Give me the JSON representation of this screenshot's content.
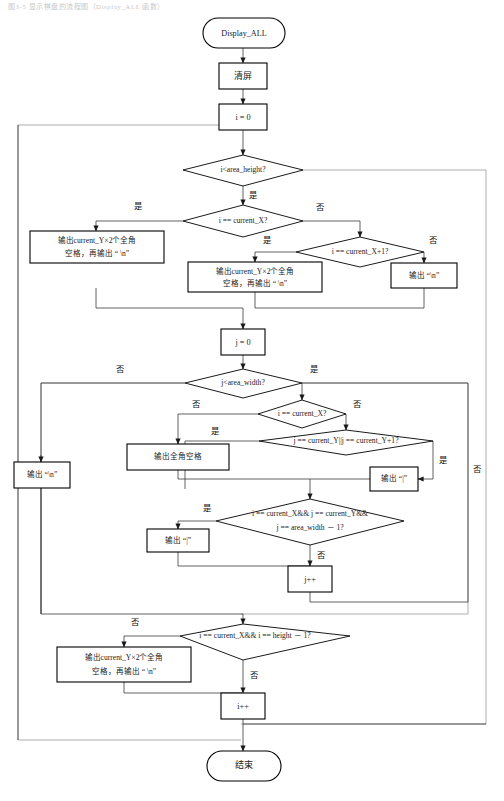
{
  "page": {
    "header_text": "图3-5  显示棋盘的流程图（Display_ALL 函数）",
    "width": 504,
    "height": 801,
    "background": "#ffffff",
    "line_color": "#000000",
    "connector_color": "#3a3a3a",
    "frame_color": "#9a9a9a"
  },
  "nodes": {
    "start": {
      "label": "Display_ALL",
      "type": "terminator"
    },
    "clear_screen": {
      "label": "清屏",
      "type": "process"
    },
    "i_init": {
      "label": "i = 0",
      "type": "process"
    },
    "cond_i_height": {
      "label": "i<area_height?",
      "type": "decision"
    },
    "cond_i_eq_cx": {
      "label": "i == current_X?",
      "type": "decision"
    },
    "cond_i_eq_cx1": {
      "label": "i == current_X+1?",
      "type": "decision"
    },
    "out_row_left": {
      "line1": "输出current_Y×2个全角",
      "line2": "空格，再输出 “      \\n”",
      "type": "process"
    },
    "out_row_mid": {
      "line1": "输出current_Y×2个全角",
      "line2": "空格，再输出 “      \\n”",
      "type": "process"
    },
    "out_newline_right": {
      "label": "输出 “\\n”",
      "type": "process"
    },
    "j_init": {
      "label": "j = 0",
      "type": "process"
    },
    "cond_j_width": {
      "label": "j<area_width?",
      "type": "decision"
    },
    "cond_i_eq_cx2": {
      "label": "i == current_X?",
      "type": "decision"
    },
    "cond_j_eq_cy": {
      "label": "j == current_Y||j == current_Y+1?",
      "type": "decision"
    },
    "out_newline_left": {
      "label": "输出 “\\n”",
      "type": "process"
    },
    "out_fullwidth_space": {
      "label": "输出全角空格",
      "type": "process"
    },
    "out_bar_right": {
      "label": "输出 “|”",
      "type": "process"
    },
    "cond_combo": {
      "line1": "i == current_X&& j == current_Y&&",
      "line2": "j == area_width － 1?",
      "type": "decision"
    },
    "out_bar_left": {
      "label": "输出 “|”",
      "type": "process"
    },
    "j_inc": {
      "label": "j++",
      "type": "process"
    },
    "cond_i_height_last": {
      "label": "i == current_X&& i == height － 1?",
      "type": "decision"
    },
    "out_row_bottom": {
      "line1": "输出current_Y×2个全角",
      "line2": "空格，再输出 “      \\n”",
      "type": "process"
    },
    "i_inc": {
      "label": "i++",
      "type": "process"
    },
    "end": {
      "label": "结束",
      "type": "terminator"
    }
  },
  "edge_labels": {
    "yes": "是",
    "no": "否",
    "e1_yes": "是",
    "e2_yes": "是",
    "e2_no": "否",
    "e3_yes": "是",
    "e3_no": "否",
    "e4_no": "否",
    "e5_yes": "是",
    "e5_no": "否",
    "e6_no": "否",
    "e7_yes": "是",
    "e8_yes": "是",
    "e8_no": "否",
    "e9_yes": "是",
    "e9_no": "否",
    "e10_no": "否"
  }
}
